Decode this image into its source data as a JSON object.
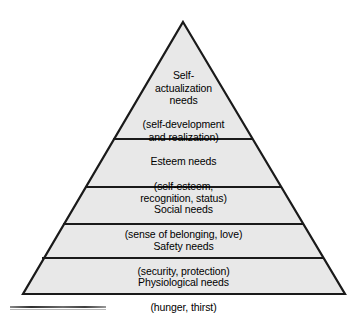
{
  "diagram": {
    "type": "pyramid",
    "name": "Maslow's hierarchy of needs",
    "fill_color": "#e8e8e8",
    "stroke_color": "#1a1a1a",
    "background_color": "#ffffff",
    "apex": {
      "x": 183,
      "y": 22
    },
    "base_left": {
      "x": 23,
      "y": 294
    },
    "base_right": {
      "x": 345,
      "y": 294
    },
    "divider_y": [
      139,
      187,
      224,
      258
    ],
    "tiers": [
      {
        "id": "self-actualization",
        "level": 5,
        "title": "Self-\nactualization\nneeds",
        "subtitle": "(self-development\nand realization)"
      },
      {
        "id": "esteem",
        "level": 4,
        "title": "Esteem needs",
        "subtitle": "(self-esteem,\nrecognition, status)"
      },
      {
        "id": "social",
        "level": 3,
        "title": "Social needs",
        "subtitle": "(sense of belonging, love)"
      },
      {
        "id": "safety",
        "level": 2,
        "title": "Safety needs",
        "subtitle": "(security, protection)"
      },
      {
        "id": "physiological",
        "level": 1,
        "title": "Physiological needs",
        "subtitle": "(hunger, thirst)"
      }
    ]
  }
}
